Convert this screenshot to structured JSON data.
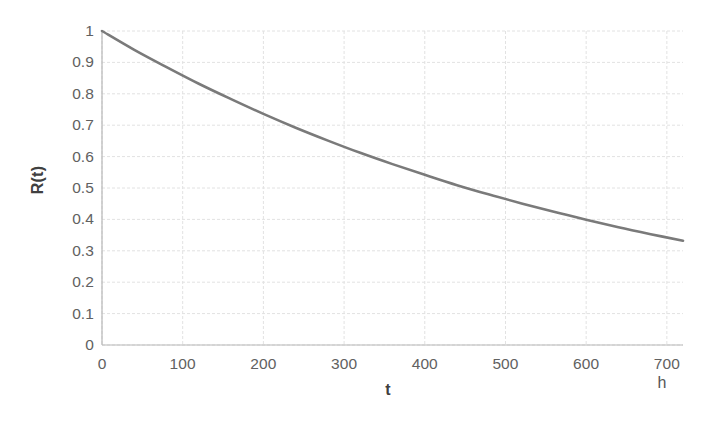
{
  "chart_data": {
    "type": "line",
    "title": "",
    "subtitle": "",
    "xlabel": "t",
    "x_unit": "h",
    "ylabel": "R(t)",
    "xlim": [
      0,
      720
    ],
    "ylim": [
      0,
      1
    ],
    "grid": true,
    "legend": "none",
    "x_ticks": [
      0,
      100,
      200,
      300,
      400,
      500,
      600,
      700
    ],
    "x_tick_labels": [
      "0",
      "100",
      "200",
      "300",
      "400",
      "500",
      "600",
      "700"
    ],
    "y_ticks": [
      0,
      0.1,
      0.2,
      0.3,
      0.4,
      0.5,
      0.6,
      0.7,
      0.8,
      0.9,
      1
    ],
    "y_tick_labels": [
      "0",
      "0.1",
      "0.2",
      "0.3",
      "0.4",
      "0.5",
      "0.6",
      "0.7",
      "0.8",
      "0.9",
      "1"
    ],
    "series": [
      {
        "name": "R(t)",
        "color": "#7a7a7a",
        "line_width": 2.6,
        "x": [
          0,
          40,
          80,
          120,
          160,
          200,
          240,
          280,
          320,
          360,
          400,
          440,
          480,
          520,
          560,
          600,
          640,
          680,
          720
        ],
        "values": [
          1.0,
          0.94,
          0.885,
          0.832,
          0.783,
          0.736,
          0.692,
          0.651,
          0.612,
          0.576,
          0.542,
          0.509,
          0.479,
          0.451,
          0.424,
          0.399,
          0.375,
          0.353,
          0.332
        ]
      }
    ]
  },
  "axes": {
    "axis_line_color": "#b8b8b8",
    "grid_color": "#e2e2e2",
    "background": "#ffffff"
  }
}
